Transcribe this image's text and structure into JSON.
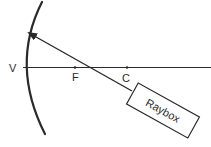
{
  "diagram": {
    "labels": {
      "vertex": "V",
      "focus": "F",
      "centre": "C",
      "raybox": "Raybox"
    },
    "colors": {
      "ink": "#2a2a2a",
      "background": "#ffffff"
    }
  }
}
